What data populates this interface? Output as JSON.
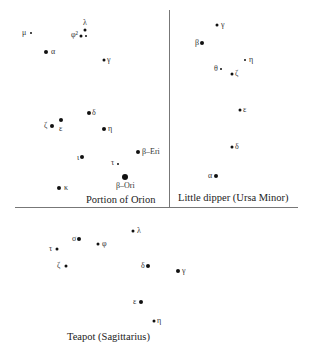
{
  "diagram": {
    "panels": [
      {
        "title": "Portion of Orion",
        "title_pos": [
          86,
          199
        ],
        "stars": [
          {
            "label": "μ",
            "dot": [
              31,
              33
            ],
            "size": 1,
            "label_pos": [
              22,
              33
            ]
          },
          {
            "label": "α",
            "dot": [
              46,
              52
            ],
            "size": 3,
            "label_pos": [
              51,
              52
            ]
          },
          {
            "label": "φ²",
            "dot": [
              81,
              36
            ],
            "size": 2,
            "label_pos": [
              71,
              35
            ]
          },
          {
            "label": "λ",
            "dot": [
              85,
              30
            ],
            "size": 2,
            "label_pos": [
              83,
              23
            ]
          },
          {
            "label": "",
            "dot": [
              86,
              36
            ],
            "size": 1,
            "label_pos": [
              86,
              36
            ]
          },
          {
            "label": "γ",
            "dot": [
              104,
              60
            ],
            "size": 2,
            "label_pos": [
              107,
              60
            ]
          },
          {
            "label": "δ",
            "dot": [
              89,
              113
            ],
            "size": 3,
            "label_pos": [
              92,
              113
            ]
          },
          {
            "label": "ζ",
            "dot": [
              52,
              126
            ],
            "size": 3,
            "label_pos": [
              44,
              126
            ]
          },
          {
            "label": "ε",
            "dot": [
              61,
              120
            ],
            "size": 3,
            "label_pos": [
              59,
              129
            ]
          },
          {
            "label": "η",
            "dot": [
              104,
              129
            ],
            "size": 3,
            "label_pos": [
              108,
              129
            ]
          },
          {
            "label": "ι",
            "dot": [
              82,
              157
            ],
            "size": 3,
            "label_pos": [
              77,
              158
            ]
          },
          {
            "label": "β–Eri",
            "dot": [
              138,
              152
            ],
            "size": 3,
            "label_pos": [
              142,
              152
            ]
          },
          {
            "label": "τ",
            "dot": [
              118,
              164
            ],
            "size": 1,
            "label_pos": [
              111,
              163
            ]
          },
          {
            "label": "β–Ori",
            "dot": [
              125,
              177
            ],
            "size": 4,
            "label_pos": [
              116,
              186
            ]
          },
          {
            "label": "κ",
            "dot": [
              59,
              188
            ],
            "size": 3,
            "label_pos": [
              64,
              188
            ]
          }
        ]
      },
      {
        "title": "Little dipper (Ursa Minor)",
        "title_pos": [
          178,
          197
        ],
        "stars": [
          {
            "label": "γ",
            "dot": [
              217,
              25
            ],
            "size": 2,
            "label_pos": [
              221,
              25
            ]
          },
          {
            "label": "β",
            "dot": [
              202,
              43
            ],
            "size": 3,
            "label_pos": [
              195,
              43
            ]
          },
          {
            "label": "η",
            "dot": [
              245,
              60
            ],
            "size": 1,
            "label_pos": [
              249,
              60
            ]
          },
          {
            "label": "θ",
            "dot": [
              221,
              69
            ],
            "size": 1,
            "label_pos": [
              214,
              69
            ]
          },
          {
            "label": "ζ",
            "dot": [
              232,
              74
            ],
            "size": 2,
            "label_pos": [
              235,
              74
            ]
          },
          {
            "label": "ε",
            "dot": [
              240,
              110
            ],
            "size": 2,
            "label_pos": [
              243,
              110
            ]
          },
          {
            "label": "δ",
            "dot": [
              232,
              147
            ],
            "size": 2,
            "label_pos": [
              235,
              147
            ]
          },
          {
            "label": "α",
            "dot": [
              216,
              176
            ],
            "size": 3,
            "label_pos": [
              208,
              176
            ]
          }
        ]
      },
      {
        "title": "Teapot (Sagittarius)",
        "title_pos": [
          67,
          336
        ],
        "stars": [
          {
            "label": "λ",
            "dot": [
              133,
              231
            ],
            "size": 2,
            "label_pos": [
              137,
              231
            ]
          },
          {
            "label": "σ",
            "dot": [
              79,
              239
            ],
            "size": 3,
            "label_pos": [
              72,
              239
            ]
          },
          {
            "label": "φ",
            "dot": [
              98,
              244
            ],
            "size": 2,
            "label_pos": [
              102,
              244
            ]
          },
          {
            "label": "τ",
            "dot": [
              57,
              249
            ],
            "size": 2,
            "label_pos": [
              49,
              249
            ]
          },
          {
            "label": "ζ",
            "dot": [
              66,
              266
            ],
            "size": 2,
            "label_pos": [
              57,
              266
            ]
          },
          {
            "label": "δ",
            "dot": [
              148,
              266
            ],
            "size": 3,
            "label_pos": [
              141,
              266
            ]
          },
          {
            "label": "γ",
            "dot": [
              178,
              271
            ],
            "size": 3,
            "label_pos": [
              182,
              271
            ]
          },
          {
            "label": "ε",
            "dot": [
              141,
              302
            ],
            "size": 3,
            "label_pos": [
              133,
              302
            ]
          },
          {
            "label": "η",
            "dot": [
              154,
              321
            ],
            "size": 2,
            "label_pos": [
              157,
              321
            ]
          }
        ]
      }
    ]
  }
}
